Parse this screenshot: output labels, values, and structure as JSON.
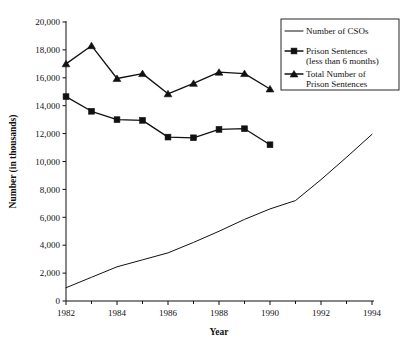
{
  "chart_data": {
    "type": "line",
    "title": "",
    "subtitle": "",
    "xlabel": "Year",
    "ylabel": "Number (in thousands)",
    "xlim": [
      1982,
      1994
    ],
    "ylim": [
      0,
      20000
    ],
    "grid": false,
    "legend_position": "top-right",
    "x_major_ticks": [
      1982,
      1984,
      1986,
      1988,
      1990,
      1992,
      1994
    ],
    "x_minor_ticks": [
      1983,
      1985,
      1987,
      1989,
      1991,
      1993
    ],
    "x_tick_labels": [
      "1982",
      "1984",
      "1986",
      "1988",
      "1990",
      "1992",
      "1994"
    ],
    "y_ticks": [
      0,
      2000,
      4000,
      6000,
      8000,
      10000,
      12000,
      14000,
      16000,
      18000,
      20000
    ],
    "y_tick_labels": [
      "0",
      "2,000",
      "4,000",
      "6,000",
      "8,000",
      "10,000",
      "12,000",
      "14,000",
      "16,000",
      "18,000",
      "20,000"
    ],
    "series": [
      {
        "name": "Number of CSOs",
        "marker": "none",
        "color": "#111111",
        "x": [
          1982,
          1983,
          1984,
          1985,
          1986,
          1987,
          1988,
          1989,
          1990,
          1991,
          1992,
          1993,
          1994
        ],
        "values": [
          950,
          1700,
          2450,
          2950,
          3450,
          4200,
          5000,
          5850,
          6600,
          7200,
          8700,
          10300,
          11950
        ]
      },
      {
        "name": "Prison Sentences (less than 6 months)",
        "marker": "square",
        "color": "#111111",
        "x": [
          1982,
          1983,
          1984,
          1985,
          1986,
          1987,
          1988,
          1989,
          1990
        ],
        "values": [
          14650,
          13600,
          13000,
          12950,
          11750,
          11700,
          12300,
          12350,
          11200
        ]
      },
      {
        "name": "Total Number of Prison Sentences",
        "marker": "triangle",
        "color": "#111111",
        "x": [
          1982,
          1983,
          1984,
          1985,
          1986,
          1987,
          1988,
          1989,
          1990
        ],
        "values": [
          17000,
          18300,
          15950,
          16300,
          14850,
          15600,
          16400,
          16300,
          15200
        ]
      }
    ]
  },
  "legend": {
    "entries": [
      {
        "label_line1": "Number of CSOs",
        "label_line2": "",
        "marker": "line"
      },
      {
        "label_line1": "Prison Sentences",
        "label_line2": "(less than 6 months)",
        "marker": "square"
      },
      {
        "label_line1": "Total Number of",
        "label_line2": "Prison Sentences",
        "marker": "triangle"
      }
    ]
  },
  "axes": {
    "x_title": "Year",
    "y_title": "Number (in thousands)"
  },
  "colors": {
    "ink": "#111111",
    "background": "#ffffff"
  }
}
